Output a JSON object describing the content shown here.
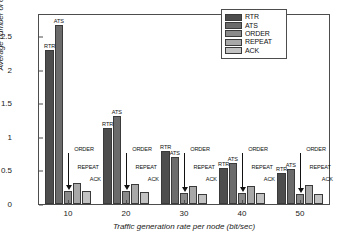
{
  "chart_data": {
    "type": "bar",
    "title": "",
    "xlabel": "Traffic generation rate per node (bit/sec)",
    "ylabel": "Average number of control packets",
    "categories": [
      "10",
      "20",
      "30",
      "40",
      "50"
    ],
    "xticklabels": [
      "10",
      "20",
      "30",
      "40",
      "50"
    ],
    "yticklabels": [
      "0",
      "0.5",
      "1",
      "1.5",
      "2",
      "2.5"
    ],
    "ytickvalues": [
      0,
      0.5,
      1,
      1.5,
      2,
      2.5
    ],
    "ylim": [
      0,
      2.82
    ],
    "grid": false,
    "legend_position": "upper right",
    "series": [
      {
        "name": "RTR",
        "color": "#4d4d4d",
        "values": [
          2.3,
          1.14,
          0.79,
          0.53,
          0.47
        ]
      },
      {
        "name": "ATS",
        "color": "#6b6b6b",
        "values": [
          2.67,
          1.32,
          0.7,
          0.61,
          0.52
        ]
      },
      {
        "name": "ORDER",
        "color": "#8a8a8a",
        "values": [
          0.19,
          0.19,
          0.16,
          0.17,
          0.15
        ]
      },
      {
        "name": "REPEAT",
        "color": "#a8a8a8",
        "values": [
          0.32,
          0.3,
          0.27,
          0.27,
          0.29
        ]
      },
      {
        "name": "ACK",
        "color": "#c2c2c2",
        "values": [
          0.19,
          0.18,
          0.15,
          0.17,
          0.15
        ]
      }
    ],
    "annotations": [
      {
        "text": "RTR",
        "group": 0,
        "series": 0
      },
      {
        "text": "ATS",
        "group": 0,
        "series": 1
      },
      {
        "text": "ORDER",
        "group": 0,
        "series": 2
      },
      {
        "text": "REPEAT",
        "group": 0,
        "series": 3
      },
      {
        "text": "ACK",
        "group": 0,
        "series": 4
      },
      {
        "text": "RTR",
        "group": 1,
        "series": 0
      },
      {
        "text": "ATS",
        "group": 1,
        "series": 1
      },
      {
        "text": "ORDER",
        "group": 1,
        "series": 2
      },
      {
        "text": "REPEAT",
        "group": 1,
        "series": 3
      },
      {
        "text": "ACK",
        "group": 1,
        "series": 4
      },
      {
        "text": "RTR",
        "group": 2,
        "series": 0
      },
      {
        "text": "ATS",
        "group": 2,
        "series": 1
      },
      {
        "text": "ORDER",
        "group": 2,
        "series": 2
      },
      {
        "text": "REPEAT",
        "group": 2,
        "series": 3
      },
      {
        "text": "ACK",
        "group": 2,
        "series": 4
      },
      {
        "text": "RTR",
        "group": 3,
        "series": 0
      },
      {
        "text": "ATS",
        "group": 3,
        "series": 1
      },
      {
        "text": "ORDER",
        "group": 3,
        "series": 2
      },
      {
        "text": "REPEAT",
        "group": 3,
        "series": 3
      },
      {
        "text": "ACK",
        "group": 3,
        "series": 4
      },
      {
        "text": "RTR",
        "group": 4,
        "series": 0
      },
      {
        "text": "ATS",
        "group": 4,
        "series": 1
      },
      {
        "text": "ORDER",
        "group": 4,
        "series": 2
      },
      {
        "text": "REPEAT",
        "group": 4,
        "series": 3
      },
      {
        "text": "ACK",
        "group": 4,
        "series": 4
      }
    ]
  },
  "legend": {
    "items": [
      {
        "label": "RTR",
        "color": "#4d4d4d"
      },
      {
        "label": "ATS",
        "color": "#6b6b6b"
      },
      {
        "label": "ORDER",
        "color": "#8a8a8a"
      },
      {
        "label": "REPEAT",
        "color": "#a8a8a8"
      },
      {
        "label": "ACK",
        "color": "#c2c2c2"
      }
    ]
  },
  "colors": {
    "axis": "#4d4d4d",
    "text": "#1a1a1a",
    "background": "#ffffff"
  }
}
